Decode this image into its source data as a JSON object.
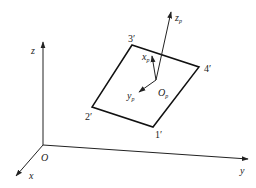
{
  "diagram": {
    "type": "coordinate-frame-diagram",
    "global_frame": {
      "origin_label": "O",
      "axes": [
        {
          "name": "x",
          "label": "x"
        },
        {
          "name": "y",
          "label": "y"
        },
        {
          "name": "z",
          "label": "z"
        }
      ]
    },
    "plate": {
      "corners": [
        {
          "id": "1",
          "label": "1′"
        },
        {
          "id": "2",
          "label": "2′"
        },
        {
          "id": "3",
          "label": "3′"
        },
        {
          "id": "4",
          "label": "4′"
        }
      ]
    },
    "local_frame": {
      "origin_label": "O",
      "origin_sub": "p",
      "axes": [
        {
          "name": "xp",
          "label": "x",
          "sub": "p"
        },
        {
          "name": "yp",
          "label": "y",
          "sub": "p"
        },
        {
          "name": "zp",
          "label": "z",
          "sub": "p"
        }
      ]
    },
    "colors": {
      "line": "#222222",
      "background": "#ffffff"
    }
  }
}
